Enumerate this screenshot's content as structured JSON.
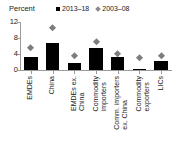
{
  "chart_data": {
    "type": "bar",
    "title": "",
    "subtitle": "",
    "unit_label": "Percent",
    "xlabel": "",
    "ylabel": "Percent",
    "ylim": [
      0,
      12
    ],
    "yticks": [
      0,
      4,
      8,
      12
    ],
    "ytick_labels": [
      "0",
      "4",
      "8",
      "12"
    ],
    "grid": false,
    "legend_position": "top-right",
    "categories": [
      "EMDEs",
      "China",
      "EMDEs ex.\nChina",
      "Commodity\nimporters",
      "Comm. importers\nex. China",
      "Commodity\nexporters",
      "LICs"
    ],
    "series": [
      {
        "name": "2013–18",
        "marker": "square",
        "color": "#000000",
        "render": "bar",
        "values": [
          3.2,
          6.8,
          1.7,
          5.4,
          3.3,
          0.3,
          2.3
        ]
      },
      {
        "name": "2003–08",
        "marker": "diamond",
        "color": "#7d7d7d",
        "render": "point",
        "values": [
          5.3,
          10.3,
          3.3,
          6.9,
          3.9,
          3.0,
          3.4
        ]
      }
    ]
  },
  "legend": {
    "entries": [
      {
        "label": "2013–18",
        "marker": "square-marker-icon"
      },
      {
        "label": "2003–08",
        "marker": "diamond-marker-icon"
      }
    ]
  },
  "colors": {
    "bar": "#000000",
    "diamond": "#7d7d7d",
    "axis": "#9a9a9a",
    "text": "#1a1a1a",
    "background": "#ffffff"
  }
}
